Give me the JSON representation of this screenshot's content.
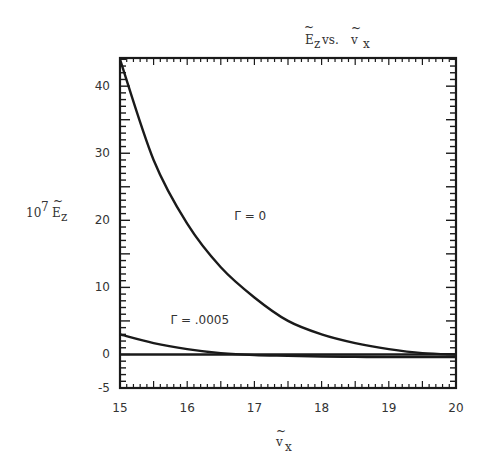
{
  "chart_data": {
    "type": "line",
    "title_parts": {
      "main": "E",
      "sub": "z",
      "mid": " vs. ",
      "main2": "v",
      "sub2": "x"
    },
    "xlabel": "ṽx",
    "xlabel_parts": {
      "main": "v",
      "sub": "x"
    },
    "ylabel": "10^7 Ẽz",
    "ylabel_parts": {
      "coef": "10",
      "exp": "7",
      "main": "E",
      "sub": "z"
    },
    "xlim": [
      15,
      20
    ],
    "ylim": [
      -5,
      44.2
    ],
    "xticks": [
      "15",
      "16",
      "17",
      "18",
      "19",
      "20"
    ],
    "yticks": [
      "40",
      "30",
      "20",
      "10",
      "0",
      "-5"
    ],
    "ytick_values": [
      40,
      30,
      20,
      10,
      0,
      -5
    ],
    "xtick_values": [
      15,
      16,
      17,
      18,
      19,
      20
    ],
    "grid": false,
    "x": [
      15,
      15.5,
      16,
      16.5,
      17,
      17.5,
      18,
      18.5,
      19,
      19.5,
      20
    ],
    "series": [
      {
        "name": "Γ = 0",
        "label": "Γ = 0",
        "values": [
          44,
          29,
          19.5,
          13,
          8.5,
          5,
          3,
          1.7,
          0.8,
          0.2,
          0
        ]
      },
      {
        "name": "Γ = .0005",
        "label": "Γ = .0005",
        "values": [
          3,
          1.7,
          0.8,
          0.2,
          -0.1,
          -0.2,
          -0.3,
          -0.35,
          -0.4,
          -0.4,
          -0.4
        ]
      },
      {
        "name": "zero line",
        "label": "",
        "values": [
          0,
          0,
          0,
          0,
          0,
          0,
          0,
          0,
          0,
          0,
          0
        ]
      }
    ],
    "annotations": [
      {
        "text": "Γ = 0",
        "x": 16.7,
        "y": 20
      },
      {
        "text": "Γ = .0005",
        "x": 15.75,
        "y": 4.5
      }
    ],
    "line_color": "#1a1a1a"
  }
}
